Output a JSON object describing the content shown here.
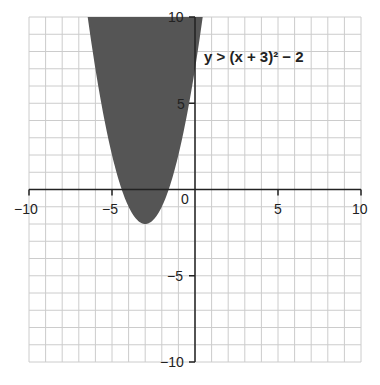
{
  "chart_data": {
    "type": "area",
    "title": "",
    "xlabel": "",
    "ylabel": "",
    "xlim": [
      -10,
      10
    ],
    "ylim": [
      -10,
      10
    ],
    "grid": true,
    "grid_step": 1,
    "x_ticks": [
      -10,
      -5,
      0,
      5,
      10
    ],
    "y_ticks": [
      -10,
      -5,
      5,
      10
    ],
    "x_tick_labels": [
      "−10",
      "−5",
      "0",
      "5",
      "10"
    ],
    "y_tick_labels": [
      "−10",
      "−5",
      "5",
      "10"
    ],
    "series": [
      {
        "name": "y > (x + 3)² − 2",
        "kind": "inequality-region",
        "boundary": "y = (x + 3)^2 - 2",
        "vertex": [
          -3,
          -2
        ],
        "shaded": "above",
        "boundary_style": "dashed-or-hidden",
        "color": "#555555"
      }
    ],
    "annotations": [
      {
        "text": "y > (x + 3)² − 2",
        "x": 1,
        "y": 8
      }
    ]
  },
  "labels": {
    "inequality": "y > (x + 3)² − 2",
    "origin": "0",
    "x_neg10": "−10",
    "x_neg5": "−5",
    "x_5": "5",
    "x_10": "10",
    "y_10": "10",
    "y_5": "5",
    "y_neg5": "−5",
    "y_neg10": "−10"
  },
  "colors": {
    "shade": "#555555",
    "grid": "#cccccc",
    "axis": "#222222"
  }
}
